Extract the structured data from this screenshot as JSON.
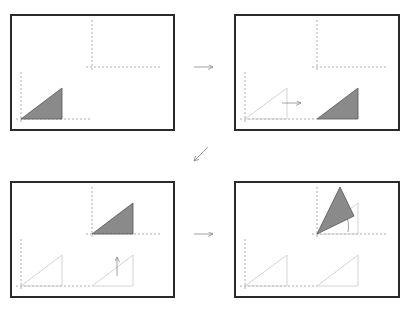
{
  "diagram": {
    "colors": {
      "frame": "#2a2a2a",
      "axis": "#9a9a9a",
      "triangle_fill": "#8a8a8a",
      "triangle_stroke": "#555555",
      "ghost": "#c8c8c8",
      "arrow": "#8a8a8a"
    },
    "panels": [
      {
        "id": "panel-1",
        "step": "original",
        "label": "Triangle at origin"
      },
      {
        "id": "panel-2",
        "step": "translate-x",
        "label": "Translate along x"
      },
      {
        "id": "panel-3",
        "step": "translate-y",
        "label": "Translate along y"
      },
      {
        "id": "panel-4",
        "step": "rotate",
        "label": "Rotate about local origin"
      }
    ],
    "flow_arrows": [
      {
        "from": "panel-1",
        "to": "panel-2",
        "direction": "right"
      },
      {
        "from": "panel-2",
        "to": "panel-3",
        "direction": "down-left"
      },
      {
        "from": "panel-3",
        "to": "panel-4",
        "direction": "right"
      }
    ]
  }
}
